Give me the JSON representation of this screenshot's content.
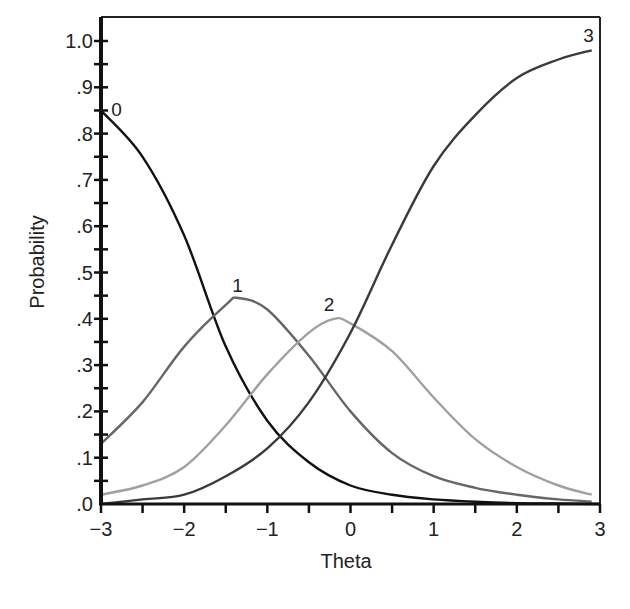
{
  "chart_data": {
    "type": "line",
    "title": "",
    "xlabel": "Theta",
    "ylabel": "Probability",
    "xlim": [
      -3,
      3
    ],
    "ylim": [
      0,
      1.05
    ],
    "grid": false,
    "legend": "none (curves labeled inline)",
    "x_ticks": [
      -3,
      -2,
      -1,
      0,
      1,
      2,
      3
    ],
    "x_tick_labels": [
      "−3",
      "−2",
      "−1",
      "0",
      "1",
      "2",
      "3"
    ],
    "y_ticks": [
      0,
      0.1,
      0.2,
      0.3,
      0.4,
      0.5,
      0.6,
      0.7,
      0.8,
      0.9,
      1.0
    ],
    "y_tick_labels": [
      ".0",
      ".1",
      ".2",
      ".3",
      ".4",
      ".5",
      ".6",
      ".7",
      ".8",
      ".9",
      "1.0"
    ],
    "series": [
      {
        "name": "0",
        "label": "0",
        "color": "#111111",
        "x": [
          -3,
          -2.5,
          -2,
          -1.5,
          -1,
          -0.5,
          0,
          0.5,
          1,
          1.5,
          2,
          2.5,
          3
        ],
        "values": [
          0.85,
          0.75,
          0.58,
          0.34,
          0.18,
          0.09,
          0.04,
          0.02,
          0.01,
          0.005,
          0.002,
          0.001,
          0.0
        ]
      },
      {
        "name": "1",
        "label": "1",
        "color": "#666666",
        "x": [
          -3,
          -2.5,
          -2,
          -1.5,
          -1.35,
          -1,
          -0.5,
          0,
          0.5,
          1,
          1.5,
          2,
          2.5,
          2.9
        ],
        "values": [
          0.13,
          0.22,
          0.34,
          0.43,
          0.445,
          0.42,
          0.32,
          0.2,
          0.11,
          0.06,
          0.035,
          0.02,
          0.01,
          0.005
        ]
      },
      {
        "name": "2",
        "label": "2",
        "color": "#a0a0a0",
        "x": [
          -3,
          -2.5,
          -2,
          -1.5,
          -1,
          -0.5,
          -0.2,
          0,
          0.5,
          1,
          1.5,
          2,
          2.5,
          2.9
        ],
        "values": [
          0.02,
          0.04,
          0.08,
          0.17,
          0.28,
          0.37,
          0.4,
          0.39,
          0.33,
          0.23,
          0.14,
          0.08,
          0.04,
          0.02
        ]
      },
      {
        "name": "3",
        "label": "3",
        "color": "#3a3a3a",
        "x": [
          -3,
          -2.5,
          -2,
          -1.5,
          -1,
          -0.5,
          0,
          0.5,
          1,
          1.5,
          2,
          2.5,
          2.9
        ],
        "values": [
          0.0,
          0.01,
          0.02,
          0.06,
          0.12,
          0.22,
          0.37,
          0.56,
          0.73,
          0.84,
          0.92,
          0.96,
          0.98
        ]
      }
    ],
    "annotations": [
      {
        "text": "0",
        "x": -2.95,
        "y": 0.85
      },
      {
        "text": "1",
        "x": -1.35,
        "y": 0.47
      },
      {
        "text": "2",
        "x": -0.25,
        "y": 0.43
      },
      {
        "text": "3",
        "x": 2.8,
        "y": 1.01
      }
    ]
  }
}
